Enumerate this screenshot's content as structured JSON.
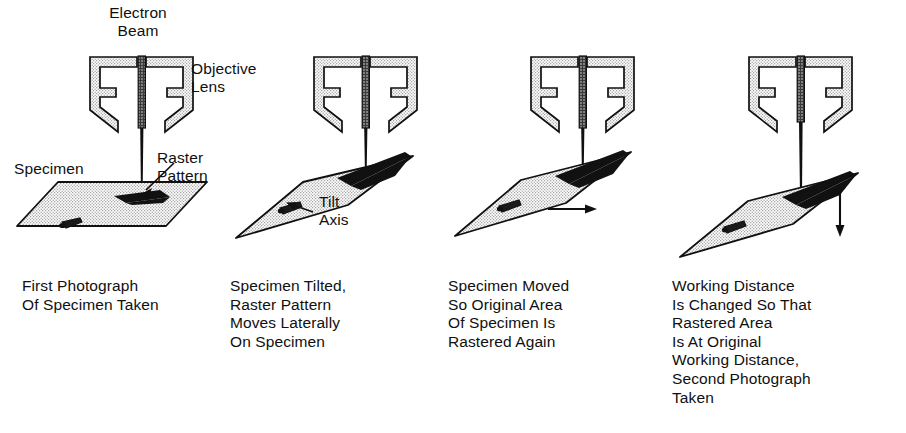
{
  "figure": {
    "background_color": "#ffffff",
    "ink_color": "#101010",
    "stipple_fill_color": "#d8d8d8",
    "raster_patch_color": "#111111"
  },
  "labels": {
    "electron_beam": "Electron\nBeam",
    "objective_lens": "Objective\nLens",
    "specimen": "Specimen",
    "raster_pattern": "Raster\nPattern",
    "tilt_axis": "Tilt\nAxis"
  },
  "panels": [
    {
      "id": "panel-1",
      "caption": "First Photograph\nOf Specimen Taken",
      "stage_state": "flat",
      "annotation_arrow": "none"
    },
    {
      "id": "panel-2",
      "caption": "Specimen Tilted,\nRaster Pattern\nMoves Laterally\nOn Specimen",
      "stage_state": "tilted",
      "annotation_arrow": "none"
    },
    {
      "id": "panel-3",
      "caption": "Specimen Moved\nSo Original Area\nOf Specimen Is\nRastered Again",
      "stage_state": "tilted",
      "annotation_arrow": "right"
    },
    {
      "id": "panel-4",
      "caption": "Working Distance\nIs Changed So That\nRastered Area\nIs At Original\nWorking Distance,\nSecond Photograph\nTaken",
      "stage_state": "tilted-lowered",
      "annotation_arrow": "down"
    }
  ]
}
